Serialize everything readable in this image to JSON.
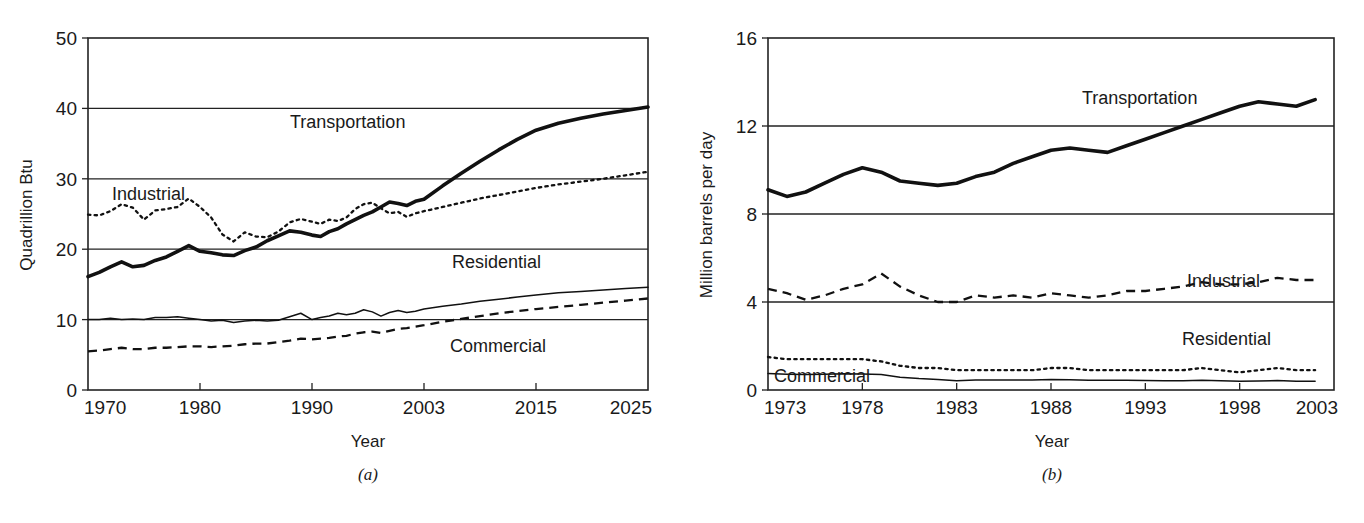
{
  "figure": {
    "panel_a_caption": "(a)",
    "panel_b_caption": "(b)"
  },
  "chart_data": [
    {
      "id": "panel-a",
      "type": "line",
      "title": "",
      "xlabel": "Year",
      "ylabel": "Quadrillion Btu",
      "ylim": [
        0,
        50
      ],
      "yticks": [
        0,
        10,
        20,
        30,
        40,
        50
      ],
      "ytick_labels": [
        "0",
        "10",
        "20",
        "30",
        "40",
        "50"
      ],
      "xticks": [
        1970,
        1980,
        1990,
        2003,
        2015,
        2025
      ],
      "xtick_labels": [
        "1970",
        "1980",
        "1990",
        "2003",
        "2015",
        "2025"
      ],
      "xlim": [
        1970,
        2025
      ],
      "grid": "horizontal",
      "legend": "inline-annotations",
      "annotations": [
        "Transportation",
        "Industrial",
        "Residential",
        "Commercial"
      ],
      "series": [
        {
          "name": "Transportation",
          "style": "thick-solid",
          "x": [
            1970,
            1971,
            1972,
            1973,
            1974,
            1975,
            1976,
            1977,
            1978,
            1979,
            1980,
            1981,
            1982,
            1983,
            1984,
            1985,
            1986,
            1987,
            1988,
            1989,
            1990,
            1991,
            1992,
            1993,
            1994,
            1995,
            1996,
            1997,
            1998,
            1999,
            2000,
            2001,
            2002,
            2003,
            2005,
            2007,
            2009,
            2011,
            2013,
            2015,
            2017,
            2019,
            2021,
            2023,
            2025
          ],
          "values": [
            16.1,
            16.7,
            17.5,
            18.2,
            17.5,
            17.7,
            18.4,
            18.9,
            19.7,
            20.5,
            19.7,
            19.5,
            19.2,
            19.1,
            19.8,
            20.3,
            21.2,
            21.9,
            22.6,
            22.4,
            22.0,
            21.8,
            22.5,
            22.9,
            23.6,
            24.2,
            24.8,
            25.3,
            26.0,
            26.7,
            26.5,
            26.2,
            26.8,
            27.1,
            29.0,
            30.8,
            32.5,
            34.1,
            35.6,
            36.9,
            37.9,
            38.6,
            39.2,
            39.7,
            40.2
          ]
        },
        {
          "name": "Industrial",
          "style": "dotted",
          "x": [
            1970,
            1971,
            1972,
            1973,
            1974,
            1975,
            1976,
            1977,
            1978,
            1979,
            1980,
            1981,
            1982,
            1983,
            1984,
            1985,
            1986,
            1987,
            1988,
            1989,
            1990,
            1991,
            1992,
            1993,
            1994,
            1995,
            1996,
            1997,
            1998,
            1999,
            2000,
            2001,
            2002,
            2003,
            2005,
            2007,
            2009,
            2011,
            2013,
            2015,
            2017,
            2019,
            2021,
            2023,
            2025
          ],
          "values": [
            24.9,
            24.8,
            25.4,
            26.4,
            25.9,
            24.2,
            25.5,
            25.7,
            26.0,
            27.2,
            26.0,
            24.5,
            22.1,
            21.1,
            22.4,
            21.8,
            21.7,
            22.5,
            23.8,
            24.3,
            23.9,
            23.6,
            24.2,
            24.0,
            24.5,
            25.7,
            26.4,
            26.6,
            25.8,
            25.1,
            25.3,
            24.6,
            25.1,
            25.4,
            26.0,
            26.6,
            27.2,
            27.7,
            28.2,
            28.7,
            29.2,
            29.6,
            30.0,
            30.5,
            31.0
          ]
        },
        {
          "name": "Residential",
          "style": "thin-solid",
          "x": [
            1970,
            1971,
            1972,
            1973,
            1974,
            1975,
            1976,
            1977,
            1978,
            1979,
            1980,
            1981,
            1982,
            1983,
            1984,
            1985,
            1986,
            1987,
            1988,
            1989,
            1990,
            1991,
            1992,
            1993,
            1994,
            1995,
            1996,
            1997,
            1998,
            1999,
            2000,
            2001,
            2002,
            2003,
            2005,
            2007,
            2009,
            2011,
            2013,
            2015,
            2017,
            2019,
            2021,
            2023,
            2025
          ],
          "values": [
            10.0,
            10.0,
            10.2,
            10.0,
            10.1,
            10.0,
            10.3,
            10.3,
            10.4,
            10.2,
            10.0,
            9.8,
            9.9,
            9.6,
            9.8,
            9.9,
            9.8,
            9.9,
            10.4,
            10.9,
            10.0,
            10.3,
            10.5,
            10.9,
            10.7,
            10.9,
            11.4,
            11.1,
            10.5,
            11.0,
            11.3,
            11.0,
            11.2,
            11.5,
            11.9,
            12.2,
            12.6,
            12.9,
            13.2,
            13.5,
            13.8,
            14.0,
            14.2,
            14.4,
            14.6
          ]
        },
        {
          "name": "Commercial",
          "style": "dashed",
          "x": [
            1970,
            1971,
            1972,
            1973,
            1974,
            1975,
            1976,
            1977,
            1978,
            1979,
            1980,
            1981,
            1982,
            1983,
            1984,
            1985,
            1986,
            1987,
            1988,
            1989,
            1990,
            1991,
            1992,
            1993,
            1994,
            1995,
            1996,
            1997,
            1998,
            1999,
            2000,
            2001,
            2002,
            2003,
            2005,
            2007,
            2009,
            2011,
            2013,
            2015,
            2017,
            2019,
            2021,
            2023,
            2025
          ],
          "values": [
            5.5,
            5.6,
            5.8,
            6.0,
            5.8,
            5.8,
            6.0,
            6.0,
            6.1,
            6.2,
            6.2,
            6.1,
            6.2,
            6.3,
            6.5,
            6.6,
            6.6,
            6.8,
            7.0,
            7.3,
            7.2,
            7.3,
            7.4,
            7.6,
            7.7,
            8.0,
            8.2,
            8.3,
            8.1,
            8.4,
            8.7,
            8.8,
            9.0,
            9.2,
            9.7,
            10.1,
            10.5,
            10.9,
            11.2,
            11.5,
            11.8,
            12.1,
            12.4,
            12.7,
            13.0
          ]
        }
      ]
    },
    {
      "id": "panel-b",
      "type": "line",
      "title": "",
      "xlabel": "Year",
      "ylabel": "Million barrels per day",
      "ylim": [
        0,
        16
      ],
      "yticks": [
        0,
        4,
        8,
        12,
        16
      ],
      "ytick_labels": [
        "0",
        "4",
        "8",
        "12",
        "16"
      ],
      "xticks": [
        1973,
        1978,
        1983,
        1988,
        1993,
        1998,
        2003
      ],
      "xtick_labels": [
        "1973",
        "1978",
        "1983",
        "1988",
        "1993",
        "1998",
        "2003"
      ],
      "xlim": [
        1973,
        2003
      ],
      "grid": "horizontal",
      "legend": "inline-annotations",
      "annotations": [
        "Transportation",
        "Industrial",
        "Residential",
        "Commercial"
      ],
      "series": [
        {
          "name": "Transportation",
          "style": "thick-solid",
          "x": [
            1973,
            1974,
            1975,
            1976,
            1977,
            1978,
            1979,
            1980,
            1981,
            1982,
            1983,
            1984,
            1985,
            1986,
            1987,
            1988,
            1989,
            1990,
            1991,
            1992,
            1993,
            1994,
            1995,
            1996,
            1997,
            1998,
            1999,
            2000,
            2001,
            2002
          ],
          "values": [
            9.1,
            8.8,
            9.0,
            9.4,
            9.8,
            10.1,
            9.9,
            9.5,
            9.4,
            9.3,
            9.4,
            9.7,
            9.9,
            10.3,
            10.6,
            10.9,
            11.0,
            10.9,
            10.8,
            11.1,
            11.4,
            11.7,
            12.0,
            12.3,
            12.6,
            12.9,
            13.1,
            13.0,
            12.9,
            13.2
          ]
        },
        {
          "name": "Industrial",
          "style": "dashed",
          "x": [
            1973,
            1974,
            1975,
            1976,
            1977,
            1978,
            1979,
            1980,
            1981,
            1982,
            1983,
            1984,
            1985,
            1986,
            1987,
            1988,
            1989,
            1990,
            1991,
            1992,
            1993,
            1994,
            1995,
            1996,
            1997,
            1998,
            1999,
            2000,
            2001,
            2002
          ],
          "values": [
            4.6,
            4.4,
            4.1,
            4.3,
            4.6,
            4.8,
            5.3,
            4.7,
            4.3,
            4.0,
            4.0,
            4.3,
            4.2,
            4.3,
            4.2,
            4.4,
            4.3,
            4.2,
            4.3,
            4.5,
            4.5,
            4.6,
            4.7,
            4.9,
            4.8,
            4.8,
            4.9,
            5.1,
            5.0,
            5.0
          ]
        },
        {
          "name": "Residential",
          "style": "dotted",
          "x": [
            1973,
            1974,
            1975,
            1976,
            1977,
            1978,
            1979,
            1980,
            1981,
            1982,
            1983,
            1984,
            1985,
            1986,
            1987,
            1988,
            1989,
            1990,
            1991,
            1992,
            1993,
            1994,
            1995,
            1996,
            1997,
            1998,
            1999,
            2000,
            2001,
            2002
          ],
          "values": [
            1.5,
            1.4,
            1.4,
            1.4,
            1.4,
            1.4,
            1.3,
            1.1,
            1.0,
            1.0,
            0.9,
            0.9,
            0.9,
            0.9,
            0.9,
            1.0,
            1.0,
            0.9,
            0.9,
            0.9,
            0.9,
            0.9,
            0.9,
            1.0,
            0.9,
            0.8,
            0.9,
            1.0,
            0.9,
            0.9
          ]
        },
        {
          "name": "Commercial",
          "style": "thin-solid",
          "x": [
            1973,
            1974,
            1975,
            1976,
            1977,
            1978,
            1979,
            1980,
            1981,
            1982,
            1983,
            1984,
            1985,
            1986,
            1987,
            1988,
            1989,
            1990,
            1991,
            1992,
            1993,
            1994,
            1995,
            1996,
            1997,
            1998,
            1999,
            2000,
            2001,
            2002
          ],
          "values": [
            0.75,
            0.72,
            0.7,
            0.72,
            0.74,
            0.73,
            0.7,
            0.58,
            0.52,
            0.48,
            0.42,
            0.46,
            0.45,
            0.46,
            0.46,
            0.48,
            0.47,
            0.44,
            0.44,
            0.44,
            0.43,
            0.42,
            0.42,
            0.44,
            0.42,
            0.4,
            0.41,
            0.43,
            0.4,
            0.4
          ]
        }
      ]
    }
  ]
}
